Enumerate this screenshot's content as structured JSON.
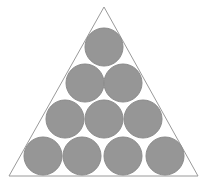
{
  "figure": {
    "name": "circles-packed-in-triangle",
    "kind": "geometry-diagram",
    "width": 208,
    "height": 185,
    "background_color": "#ffffff",
    "circle_count": 10,
    "row_counts": [
      1,
      2,
      3,
      4
    ]
  },
  "colors": {
    "background": "#ffffff",
    "circle_fill": "#969696",
    "circle_stroke": "#8a8a8a",
    "triangle_stroke": "#9a9a9a"
  },
  "triangle": {
    "name": "outer-triangle",
    "stroke_width": 1,
    "fill": "none",
    "apex": {
      "x": 104,
      "y": 7
    },
    "bottom_left": {
      "x": 9,
      "y": 176
    },
    "bottom_right": {
      "x": 198,
      "y": 176
    },
    "points": "104,7 198,176 9,176"
  },
  "circles": {
    "radius": 19,
    "diameter": 38,
    "stroke_width": 1,
    "rows": [
      {
        "name": "circle-row-1",
        "index": 1,
        "count": 1,
        "center_y": 47,
        "items": [
          {
            "name": "circle-r1-c1",
            "cx": 104,
            "cy": 47,
            "r": 19
          }
        ]
      },
      {
        "name": "circle-row-2",
        "index": 2,
        "count": 2,
        "center_y": 83,
        "items": [
          {
            "name": "circle-r2-c1",
            "cx": 85,
            "cy": 83,
            "r": 19
          },
          {
            "name": "circle-r2-c2",
            "cx": 123,
            "cy": 83,
            "r": 19
          }
        ]
      },
      {
        "name": "circle-row-3",
        "index": 3,
        "count": 3,
        "center_y": 119,
        "items": [
          {
            "name": "circle-r3-c1",
            "cx": 65,
            "cy": 119,
            "r": 19
          },
          {
            "name": "circle-r3-c2",
            "cx": 104,
            "cy": 119,
            "r": 19
          },
          {
            "name": "circle-r3-c3",
            "cx": 143,
            "cy": 119,
            "r": 19
          }
        ]
      },
      {
        "name": "circle-row-4",
        "index": 4,
        "count": 4,
        "center_y": 156,
        "items": [
          {
            "name": "circle-r4-c1",
            "cx": 43,
            "cy": 156,
            "r": 19
          },
          {
            "name": "circle-r4-c2",
            "cx": 82,
            "cy": 156,
            "r": 19
          },
          {
            "name": "circle-r4-c3",
            "cx": 123,
            "cy": 156,
            "r": 19
          },
          {
            "name": "circle-r4-c4",
            "cx": 165,
            "cy": 156,
            "r": 19
          }
        ]
      }
    ]
  },
  "labels": {
    "visible_text": []
  }
}
